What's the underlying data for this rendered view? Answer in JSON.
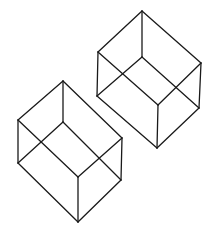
{
  "canvas": {
    "width": 216,
    "height": 234,
    "background": "#ffffff"
  },
  "style": {
    "stroke": "#1a1a1a",
    "stroke_width": 1.3
  },
  "cubes": [
    {
      "name": "left-cube",
      "vertices": {
        "top": [
          63,
          81
        ],
        "left_upper": [
          18,
          120
        ],
        "right_upper": [
          122,
          138
        ],
        "inner": [
          63,
          122
        ],
        "left_lower": [
          18,
          163
        ],
        "right_lower": [
          121,
          180
        ],
        "front": [
          78,
          177
        ],
        "bottom": [
          78,
          222
        ]
      }
    },
    {
      "name": "right-cube",
      "vertices": {
        "top": [
          142,
          11
        ],
        "left_upper": [
          98,
          52
        ],
        "right_upper": [
          201,
          63
        ],
        "inner": [
          142,
          57
        ],
        "left_lower": [
          97,
          96
        ],
        "right_lower": [
          199,
          108
        ],
        "front": [
          158,
          105
        ],
        "bottom": [
          157,
          148
        ]
      }
    }
  ],
  "edges": [
    [
      "top",
      "left_upper"
    ],
    [
      "top",
      "right_upper"
    ],
    [
      "top",
      "inner"
    ],
    [
      "inner",
      "left_lower"
    ],
    [
      "inner",
      "right_lower"
    ],
    [
      "left_upper",
      "left_lower"
    ],
    [
      "right_upper",
      "right_lower"
    ],
    [
      "left_upper",
      "front"
    ],
    [
      "right_upper",
      "front"
    ],
    [
      "front",
      "bottom"
    ],
    [
      "left_lower",
      "bottom"
    ],
    [
      "right_lower",
      "bottom"
    ]
  ]
}
